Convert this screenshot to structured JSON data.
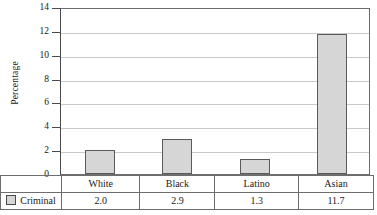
{
  "chart_data": {
    "type": "bar",
    "title": "",
    "xlabel": "",
    "ylabel": "Percentage",
    "categories": [
      "White",
      "Black",
      "Latino",
      "Asian"
    ],
    "series": [
      {
        "name": "Criminal",
        "values": [
          2.0,
          2.9,
          1.3,
          11.7
        ],
        "value_labels": [
          "2.0",
          "2.9",
          "1.3",
          "11.7"
        ],
        "color": "#d6d6d6",
        "border_color": "#5a5a5a"
      }
    ],
    "ylim": [
      0,
      14
    ],
    "yticks": [
      0,
      2,
      4,
      6,
      8,
      10,
      12,
      14
    ],
    "ytick_labels": [
      "0",
      "2",
      "4",
      "6",
      "8",
      "10",
      "12",
      "14"
    ],
    "grid": true,
    "grid_color": "#c9c9c9",
    "legend_position": "bottom-left-table",
    "has_data_table": true
  },
  "table": {
    "legend_label": "Criminal",
    "category_row": [
      "White",
      "Black",
      "Latino",
      "Asian"
    ],
    "value_row": [
      "2.0",
      "2.9",
      "1.3",
      "11.7"
    ]
  },
  "axis": {
    "y_title": "Percentage"
  }
}
